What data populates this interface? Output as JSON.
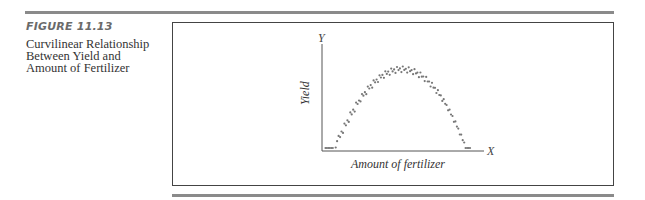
{
  "figure": {
    "label": "FIGURE 11.13",
    "caption_lines": [
      "Curvilinear Relationship",
      "Between Yield and",
      "Amount of Fertilizer"
    ]
  },
  "chart_data": {
    "type": "scatter",
    "title": "Curvilinear Relationship Between Yield and Amount of Fertilizer",
    "xlabel": "Amount of fertilizer",
    "ylabel": "Yield",
    "x_axis_letter": "X",
    "y_axis_letter": "Y",
    "xlim": [
      0,
      100
    ],
    "ylim": [
      0,
      100
    ],
    "grid": false,
    "ticks": "none",
    "point_color": "#777777",
    "points": [
      [
        1,
        15
      ],
      [
        2,
        5
      ],
      [
        3,
        21
      ],
      [
        5,
        8
      ],
      [
        6,
        12
      ],
      [
        4,
        2
      ],
      [
        8,
        4
      ],
      [
        9,
        17
      ],
      [
        10,
        26
      ],
      [
        11,
        10
      ],
      [
        12,
        21
      ],
      [
        13,
        5
      ],
      [
        14,
        31
      ],
      [
        15,
        14
      ],
      [
        16,
        24
      ],
      [
        17,
        8
      ],
      [
        18,
        36
      ],
      [
        19,
        19
      ],
      [
        20,
        29
      ],
      [
        21,
        13
      ],
      [
        22,
        40
      ],
      [
        23,
        27
      ],
      [
        24,
        33
      ],
      [
        25,
        22
      ],
      [
        26,
        44
      ],
      [
        27,
        31
      ],
      [
        28,
        38
      ],
      [
        29,
        24
      ],
      [
        30,
        48
      ],
      [
        31,
        35
      ],
      [
        32,
        43
      ],
      [
        33,
        28
      ],
      [
        34,
        52
      ],
      [
        35,
        40
      ],
      [
        36,
        47
      ],
      [
        37,
        33
      ],
      [
        38,
        56
      ],
      [
        39,
        44
      ],
      [
        40,
        51
      ],
      [
        41,
        37
      ],
      [
        42,
        60
      ],
      [
        43,
        48
      ],
      [
        44,
        55
      ],
      [
        45,
        41
      ],
      [
        46,
        64
      ],
      [
        47,
        52
      ],
      [
        48,
        59
      ],
      [
        49,
        45
      ],
      [
        50,
        68
      ],
      [
        51,
        56
      ],
      [
        52,
        63
      ],
      [
        53,
        49
      ],
      [
        54,
        72
      ],
      [
        55,
        60
      ],
      [
        56,
        66
      ],
      [
        57,
        53
      ],
      [
        58,
        76
      ],
      [
        59,
        63
      ],
      [
        60,
        70
      ],
      [
        61,
        57
      ],
      [
        62,
        80
      ],
      [
        63,
        67
      ],
      [
        64,
        74
      ],
      [
        65,
        60
      ],
      [
        66,
        83
      ],
      [
        67,
        71
      ],
      [
        68,
        77
      ],
      [
        69,
        64
      ],
      [
        70,
        86
      ],
      [
        71,
        74
      ],
      [
        72,
        80
      ],
      [
        73,
        67
      ],
      [
        74,
        88
      ],
      [
        75,
        76
      ],
      [
        76,
        83
      ],
      [
        77,
        70
      ],
      [
        78,
        89
      ],
      [
        79,
        78
      ],
      [
        80,
        85
      ],
      [
        81,
        72
      ],
      [
        82,
        88
      ],
      [
        83,
        79
      ],
      [
        84,
        84
      ],
      [
        85,
        73
      ],
      [
        86,
        86
      ],
      [
        87,
        77
      ],
      [
        88,
        82
      ],
      [
        89,
        70
      ],
      [
        90,
        83
      ],
      [
        91,
        74
      ],
      [
        92,
        78
      ],
      [
        93,
        67
      ],
      [
        94,
        79
      ],
      [
        95,
        70
      ],
      [
        96,
        74
      ],
      [
        97,
        63
      ],
      [
        98,
        75
      ],
      [
        99,
        65
      ],
      [
        100,
        69
      ]
    ],
    "point_style": {
      "radius": 1.1
    }
  }
}
